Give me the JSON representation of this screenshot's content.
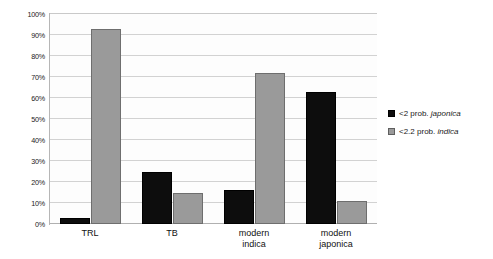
{
  "chart_data": {
    "type": "bar",
    "title": "",
    "subtitle": "",
    "xlabel": "",
    "ylabel": "",
    "ylim": [
      0,
      100
    ],
    "y_unit": "%",
    "grid": true,
    "legend_position": "right",
    "categories": [
      "TRL",
      "TB",
      "modern indica",
      "modern japonica"
    ],
    "category_lines": [
      [
        "TRL"
      ],
      [
        "TB"
      ],
      [
        "modern",
        "indica"
      ],
      [
        "modern",
        "japonica"
      ]
    ],
    "ytick_labels": [
      "0%",
      "10%",
      "20%",
      "30%",
      "40%",
      "50%",
      "60%",
      "70%",
      "80%",
      "90%",
      "100%"
    ],
    "ytick_values": [
      0,
      10,
      20,
      30,
      40,
      50,
      60,
      70,
      80,
      90,
      100
    ],
    "series": [
      {
        "name": "<2 prob. japonica",
        "name_prefix": "<2 prob. ",
        "name_species": "japonica",
        "color": "#0d0d0d",
        "values": [
          3,
          25,
          16,
          63
        ]
      },
      {
        "name": "<2.2 prob. indica",
        "name_prefix": "<2.2 prob. ",
        "name_species": "indica",
        "color": "#9a9a9a",
        "values": [
          93,
          15,
          72,
          11
        ]
      }
    ]
  },
  "colors": {
    "series_japonica": "#0d0d0d",
    "series_indica": "#9a9a9a",
    "gridline": "#d2d2d2",
    "axis": "#b6b6b6",
    "background": "#ffffff",
    "plot_background": "#fdfdfd",
    "text": "#1a1a1a"
  }
}
